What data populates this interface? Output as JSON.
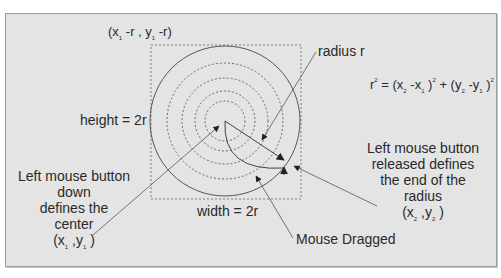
{
  "diagram": {
    "colors": {
      "background": "#e4e4e4",
      "stroke": "#555555",
      "text": "#2a2a2a"
    },
    "geometry": {
      "center": [
        225,
        121
      ],
      "outer_radius": 75,
      "dashed_radii": [
        20,
        30,
        43,
        58
      ],
      "bounding_square": {
        "x": 151,
        "y": 45,
        "w": 150,
        "h": 154
      }
    },
    "labels": {
      "top_corner": {
        "open": "(x",
        "sub1": "1",
        "mid": " -r , y",
        "sub2": "1",
        "close": " -r)"
      },
      "height": "height = 2r",
      "width": "width = 2r",
      "radius": "radius r",
      "formula": {
        "r": "r",
        "r_exp": "2",
        "eq": " = (x",
        "x2_sub": "2",
        "minus1": " -x",
        "x1_sub": "1",
        "close1": " )",
        "exp1": "2",
        "plus": " + (y",
        "y2_sub": "2",
        "minus2": " -y",
        "y1_sub": "1",
        "close2": " )",
        "exp2": "2"
      },
      "left_block": {
        "line1": "Left mouse button",
        "line2": "down",
        "line3": "defines the",
        "line4": "center",
        "coord_open": "(x",
        "coord_sub1": "1",
        "coord_mid": " ,y",
        "coord_sub2": "1",
        "coord_close": " )"
      },
      "right_block": {
        "line1": "Left mouse button",
        "line2": "released defines",
        "line3": "the end of the",
        "line4": "radius",
        "coord_open": "(x",
        "coord_sub1": "2",
        "coord_mid": " ,y",
        "coord_sub2": "2",
        "coord_close": " )"
      },
      "dragged": "Mouse Dragged"
    }
  }
}
